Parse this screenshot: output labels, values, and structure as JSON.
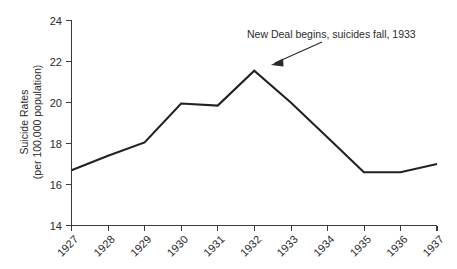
{
  "chart_data": {
    "type": "line",
    "title": "",
    "xlabel": "",
    "ylabel": "Suicide Rates (per 100,000 population)",
    "ylabel_line1": "Suicide Rates",
    "ylabel_line2": "(per 100,000 population)",
    "categories": [
      "1927",
      "1928",
      "1929",
      "1930",
      "1931",
      "1932",
      "1933",
      "1934",
      "1935",
      "1936",
      "1937"
    ],
    "values": [
      16.7,
      17.4,
      18.05,
      19.95,
      19.85,
      21.55,
      20.0,
      18.3,
      16.6,
      16.6,
      17.0
    ],
    "series": [
      {
        "name": "Suicide Rates",
        "values": [
          16.7,
          17.4,
          18.05,
          19.95,
          19.85,
          21.55,
          20.0,
          18.3,
          16.6,
          16.6,
          17.0
        ],
        "color": "#222222"
      }
    ],
    "ylim": [
      14,
      24
    ],
    "yticks": [
      14,
      16,
      18,
      20,
      22,
      24
    ],
    "ytick_labels": [
      "14",
      "16",
      "18",
      "20",
      "22",
      "24"
    ],
    "xtick_labels": [
      "1927",
      "1928",
      "1929",
      "1930",
      "1931",
      "1932",
      "1933",
      "1934",
      "1935",
      "1936",
      "1937"
    ],
    "xtick_rotation": -45,
    "grid": false,
    "legend": false,
    "legend_position": "none",
    "annotations": [
      {
        "text": "New Deal begins, suicides fall, 1933",
        "points_to_x": "1932",
        "points_to_y": 21.0
      }
    ],
    "colors": {
      "line": "#222222",
      "axis": "#3a3a3a",
      "text": "#2b2b2b",
      "background": "#ffffff"
    }
  }
}
